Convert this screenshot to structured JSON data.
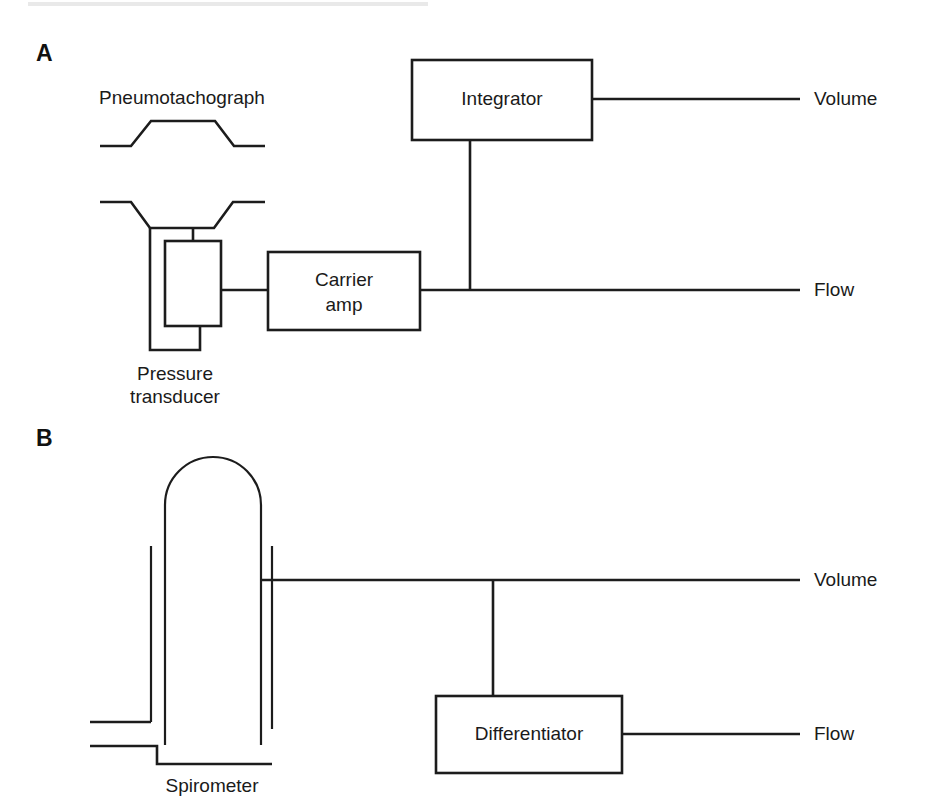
{
  "figure": {
    "panels": [
      {
        "letter": "A",
        "title_hidden": "",
        "device_label": "Pneumotachograph",
        "transducer_label_line1": "Pressure",
        "transducer_label_line2": "transducer",
        "blocks": [
          {
            "name": "integrator",
            "label": "Integrator"
          },
          {
            "name": "carrier-amp",
            "label_line1": "Carrier",
            "label_line2": "amp"
          }
        ],
        "outputs": [
          {
            "name": "volume",
            "label": "Volume"
          },
          {
            "name": "flow",
            "label": "Flow"
          }
        ]
      },
      {
        "letter": "B",
        "device_label": "Spirometer",
        "blocks": [
          {
            "name": "differentiator",
            "label": "Differentiator"
          }
        ],
        "outputs": [
          {
            "name": "volume",
            "label": "Volume"
          },
          {
            "name": "flow",
            "label": "Flow"
          }
        ]
      }
    ],
    "colors": {
      "ink": "#1c1c1c",
      "background": "#ffffff"
    }
  }
}
